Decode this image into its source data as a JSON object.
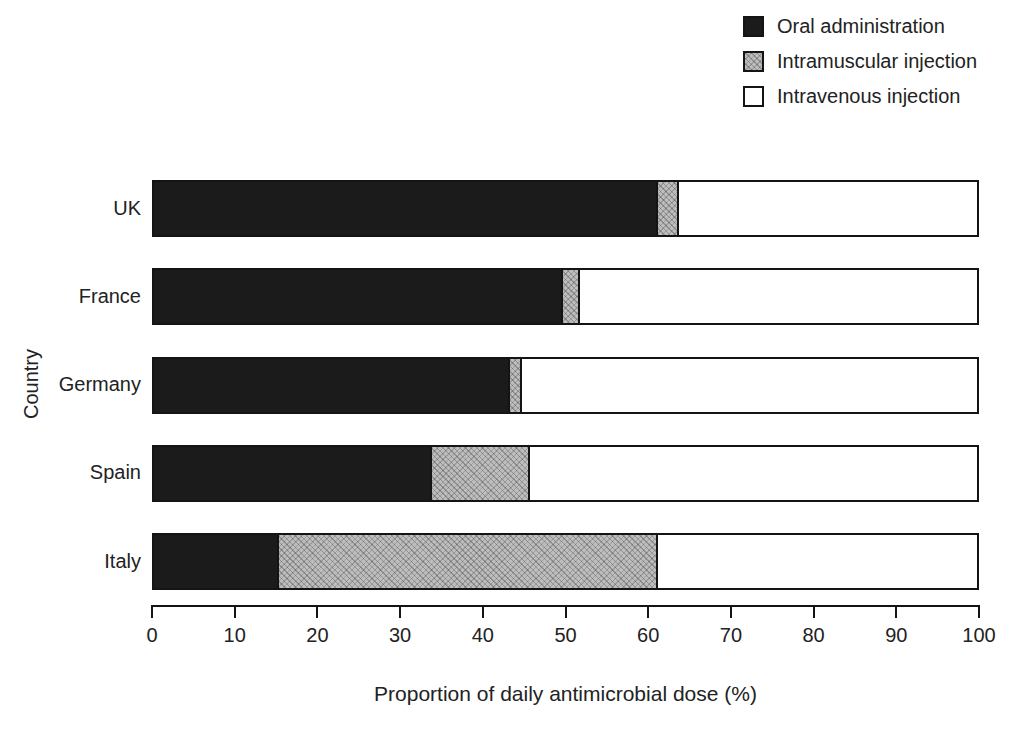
{
  "figure": {
    "background": "#ffffff",
    "axis_color": "#141414",
    "text_color": "#222222"
  },
  "chart_data": {
    "type": "bar",
    "orientation": "horizontal",
    "stacked": true,
    "xlabel": "Proportion of daily antimicrobial dose (%)",
    "ylabel": "Country",
    "xlim": [
      0,
      100
    ],
    "xticks": [
      0,
      10,
      20,
      30,
      40,
      50,
      60,
      70,
      80,
      90,
      100
    ],
    "grid": false,
    "legend_position": "top-right",
    "categories": [
      "UK",
      "France",
      "Germany",
      "Spain",
      "Italy"
    ],
    "series": [
      {
        "name": "Oral administration",
        "style": "solid-black",
        "color": "#1b1b1b",
        "values": [
          61,
          49.5,
          43,
          33.5,
          15
        ]
      },
      {
        "name": "Intramuscular injection",
        "style": "hatch-gray",
        "color": "#bdbdbd",
        "values": [
          2.5,
          2,
          1.5,
          12,
          46
        ]
      },
      {
        "name": "Intravenous injection",
        "style": "plain-white",
        "color": "#ffffff",
        "values": [
          36.5,
          48.5,
          55.5,
          54.5,
          39
        ]
      }
    ]
  }
}
